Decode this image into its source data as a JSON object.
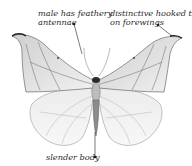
{
  "figure": {
    "annotations": [
      {
        "id": "antennae",
        "lines": [
          "male has feathery",
          "antennae"
        ]
      },
      {
        "id": "hooked-tip",
        "lines": [
          "distinctive hooked tip",
          "on forewings"
        ]
      },
      {
        "id": "body",
        "lines": [
          "slender body"
        ]
      }
    ]
  }
}
